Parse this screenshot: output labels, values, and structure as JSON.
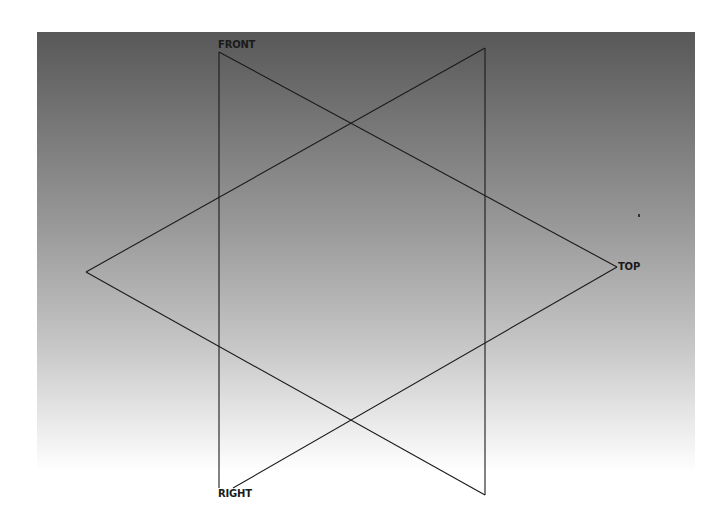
{
  "diagram": {
    "type": "view-cube-wireframe",
    "labels": {
      "front": "FRONT",
      "top": "TOP",
      "right": "RIGHT"
    },
    "colors": {
      "background_top": "#585858",
      "background_bottom": "#ffffff",
      "line": "#1a1a1a"
    },
    "vertices": {
      "front": [
        219,
        52
      ],
      "back_top": [
        485,
        48
      ],
      "left": [
        86,
        272
      ],
      "top": [
        617,
        267
      ],
      "right": [
        233,
        488
      ],
      "front_bottom": [
        219,
        488
      ],
      "back_bottom": [
        485,
        495
      ]
    },
    "edges": [
      {
        "from": "front",
        "to": "front_bottom"
      },
      {
        "from": "back_top",
        "to": "back_bottom"
      },
      {
        "from": "front",
        "to": "top"
      },
      {
        "from": "back_top",
        "to": "left"
      },
      {
        "from": "left",
        "to": "back_bottom"
      },
      {
        "from": "top",
        "to": "right"
      }
    ]
  }
}
